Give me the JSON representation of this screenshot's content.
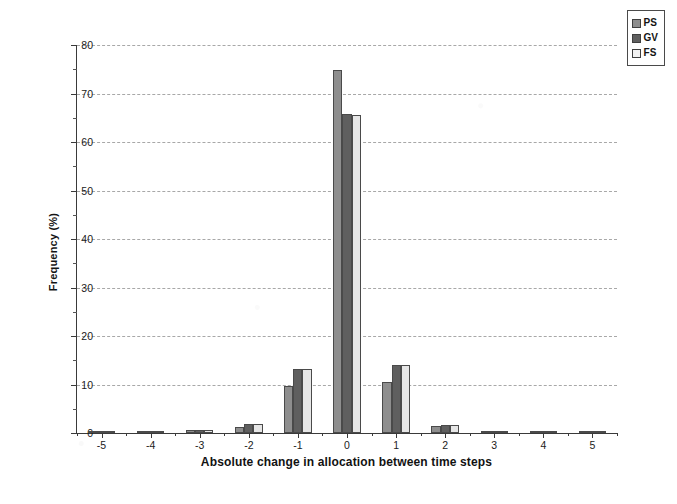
{
  "chart_data": {
    "type": "bar",
    "title": "",
    "subtitle": "",
    "xlabel": "Absolute change in allocation between time steps",
    "ylabel": "Frequency (%)",
    "ylim": [
      0,
      80
    ],
    "ytick_step": 10,
    "yticks": [
      "0",
      "10",
      "20",
      "30",
      "40",
      "50",
      "60",
      "70",
      "80"
    ],
    "grid": "horizontal-dashed",
    "legend_position": "top-right",
    "categories": [
      "-5",
      "-4",
      "-3",
      "-2",
      "-1",
      "0",
      "1",
      "2",
      "3",
      "4",
      "5"
    ],
    "series": [
      {
        "name": "PS",
        "color": "#8e8e8e",
        "values": [
          0.3,
          0.4,
          0.6,
          1.3,
          9.7,
          74.8,
          10.5,
          1.5,
          0.5,
          0.2,
          0.2
        ]
      },
      {
        "name": "GV",
        "color": "#5f5f5f",
        "values": [
          0.2,
          0.4,
          0.7,
          1.9,
          13.3,
          65.7,
          14.0,
          1.7,
          0.5,
          0.2,
          0.2
        ]
      },
      {
        "name": "FS",
        "color": "#e6e6e6",
        "values": [
          0.2,
          0.4,
          0.7,
          1.9,
          13.3,
          65.5,
          14.1,
          1.7,
          0.5,
          0.2,
          0.2
        ]
      }
    ]
  },
  "legend": {
    "items": [
      {
        "label": "PS",
        "swatch": "ps"
      },
      {
        "label": "GV",
        "swatch": "gv"
      },
      {
        "label": "FS",
        "swatch": "fs"
      }
    ]
  }
}
